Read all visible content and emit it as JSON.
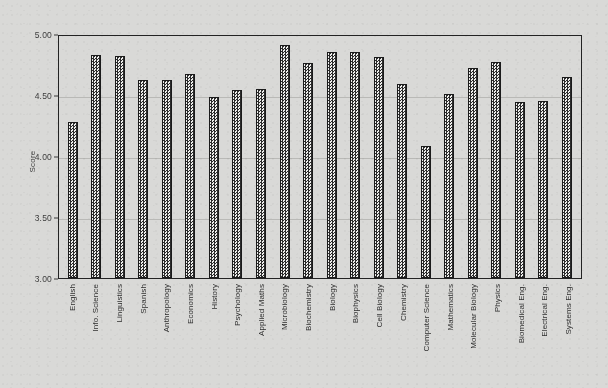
{
  "chart_data": {
    "type": "bar",
    "title": "",
    "xlabel": "",
    "ylabel": "Score",
    "ylim": [
      3.0,
      5.0
    ],
    "ytick_labels": [
      "5.00",
      "4.50",
      "4.00",
      "3.50",
      "3.00"
    ],
    "ytick_values": [
      5.0,
      4.5,
      4.0,
      3.5,
      3.0
    ],
    "grid": "horizontal",
    "legend": "none",
    "bar_style": "dark checkered hatch with black outline",
    "categories": [
      "English",
      "Info. Science",
      "Linguistics",
      "Spanish",
      "Anthropology",
      "Economics",
      "History",
      "Psychology",
      "Applied Maths",
      "Microbiology",
      "Biochemistry",
      "Biology",
      "Biophysics",
      "Cell Biology",
      "Chemistry",
      "Computer Science",
      "Mathematics",
      "Molecular Biology",
      "Physics",
      "Biomedical Eng.",
      "Electrical Eng.",
      "Systems Eng."
    ],
    "values": [
      4.28,
      4.83,
      4.82,
      4.62,
      4.62,
      4.67,
      4.48,
      4.54,
      4.55,
      4.91,
      4.76,
      4.85,
      4.85,
      4.81,
      4.59,
      4.08,
      4.51,
      4.72,
      4.77,
      4.44,
      4.45,
      4.65
    ]
  },
  "colors": {
    "background": "#d9d9d7",
    "axis": "#232323",
    "gridline": "#b9b9b6",
    "bar_dark": "#2b2b2b",
    "bar_light": "#efefed",
    "text": "#3a3a3a"
  }
}
